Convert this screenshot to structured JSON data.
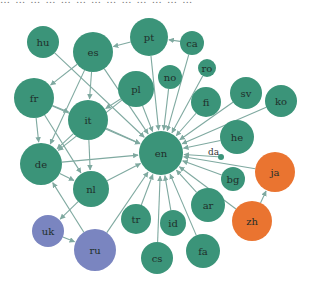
{
  "caption": "… … … … … … … … … … … … …",
  "colors": {
    "green": "#3b9479",
    "orange": "#ea7430",
    "blue": "#7a85c0",
    "edge": "#7fa9a0"
  },
  "nodes": [
    {
      "id": "en",
      "label": "en",
      "x": 161,
      "y": 153,
      "r": 22,
      "group": "green"
    },
    {
      "id": "hu",
      "label": "hu",
      "x": 43,
      "y": 42,
      "r": 16,
      "group": "green"
    },
    {
      "id": "es",
      "label": "es",
      "x": 93,
      "y": 52,
      "r": 20,
      "group": "green"
    },
    {
      "id": "pt",
      "label": "pt",
      "x": 149,
      "y": 37,
      "r": 19,
      "group": "green"
    },
    {
      "id": "ca",
      "label": "ca",
      "x": 192,
      "y": 43,
      "r": 12,
      "group": "green"
    },
    {
      "id": "ro",
      "label": "ro",
      "x": 207,
      "y": 68,
      "r": 9,
      "group": "green"
    },
    {
      "id": "no",
      "label": "no",
      "x": 170,
      "y": 77,
      "r": 12,
      "group": "green"
    },
    {
      "id": "pl",
      "label": "pl",
      "x": 136,
      "y": 89,
      "r": 18,
      "group": "green"
    },
    {
      "id": "fr",
      "label": "fr",
      "x": 34,
      "y": 98,
      "r": 20,
      "group": "green"
    },
    {
      "id": "it",
      "label": "it",
      "x": 88,
      "y": 120,
      "r": 20,
      "group": "green"
    },
    {
      "id": "fi",
      "label": "fi",
      "x": 206,
      "y": 102,
      "r": 15,
      "group": "green"
    },
    {
      "id": "sv",
      "label": "sv",
      "x": 246,
      "y": 93,
      "r": 16,
      "group": "green"
    },
    {
      "id": "ko",
      "label": "ko",
      "x": 281,
      "y": 101,
      "r": 16,
      "group": "green"
    },
    {
      "id": "he",
      "label": "he",
      "x": 237,
      "y": 137,
      "r": 17,
      "group": "green"
    },
    {
      "id": "da",
      "label": "da",
      "x": 221,
      "y": 157,
      "r": 3,
      "group": "green"
    },
    {
      "id": "bg",
      "label": "bg",
      "x": 233,
      "y": 179,
      "r": 12,
      "group": "green"
    },
    {
      "id": "de",
      "label": "de",
      "x": 41,
      "y": 164,
      "r": 21,
      "group": "green"
    },
    {
      "id": "nl",
      "label": "nl",
      "x": 91,
      "y": 189,
      "r": 18,
      "group": "green"
    },
    {
      "id": "ar",
      "label": "ar",
      "x": 208,
      "y": 205,
      "r": 17,
      "group": "green"
    },
    {
      "id": "tr",
      "label": "tr",
      "x": 136,
      "y": 219,
      "r": 15,
      "group": "green"
    },
    {
      "id": "id",
      "label": "id",
      "x": 173,
      "y": 223,
      "r": 13,
      "group": "green"
    },
    {
      "id": "cs",
      "label": "cs",
      "x": 157,
      "y": 258,
      "r": 16,
      "group": "green"
    },
    {
      "id": "fa",
      "label": "fa",
      "x": 203,
      "y": 251,
      "r": 17,
      "group": "green"
    },
    {
      "id": "ja",
      "label": "ja",
      "x": 275,
      "y": 172,
      "r": 20,
      "group": "orange"
    },
    {
      "id": "zh",
      "label": "zh",
      "x": 252,
      "y": 221,
      "r": 20,
      "group": "orange"
    },
    {
      "id": "uk",
      "label": "uk",
      "x": 48,
      "y": 231,
      "r": 16,
      "group": "blue"
    },
    {
      "id": "ru",
      "label": "ru",
      "x": 95,
      "y": 250,
      "r": 21,
      "group": "blue"
    }
  ],
  "edges": [
    [
      "hu",
      "en"
    ],
    [
      "es",
      "en"
    ],
    [
      "pt",
      "en"
    ],
    [
      "ca",
      "en"
    ],
    [
      "ro",
      "en"
    ],
    [
      "no",
      "en"
    ],
    [
      "pl",
      "en"
    ],
    [
      "fr",
      "en"
    ],
    [
      "it",
      "en"
    ],
    [
      "fi",
      "en"
    ],
    [
      "sv",
      "en"
    ],
    [
      "ko",
      "en"
    ],
    [
      "he",
      "en"
    ],
    [
      "da",
      "en"
    ],
    [
      "bg",
      "en"
    ],
    [
      "de",
      "en"
    ],
    [
      "nl",
      "en"
    ],
    [
      "ar",
      "en"
    ],
    [
      "tr",
      "en"
    ],
    [
      "id",
      "en"
    ],
    [
      "cs",
      "en"
    ],
    [
      "fa",
      "en"
    ],
    [
      "ja",
      "en"
    ],
    [
      "zh",
      "en"
    ],
    [
      "ru",
      "en"
    ],
    [
      "es",
      "fr"
    ],
    [
      "es",
      "it"
    ],
    [
      "es",
      "de"
    ],
    [
      "pt",
      "es"
    ],
    [
      "ca",
      "pt"
    ],
    [
      "fr",
      "it"
    ],
    [
      "fr",
      "de"
    ],
    [
      "fr",
      "nl"
    ],
    [
      "it",
      "de"
    ],
    [
      "it",
      "nl"
    ],
    [
      "de",
      "nl"
    ],
    [
      "nl",
      "uk"
    ],
    [
      "uk",
      "ru"
    ],
    [
      "ru",
      "de"
    ],
    [
      "zh",
      "ja"
    ],
    [
      "pl",
      "it"
    ],
    [
      "pl",
      "de"
    ]
  ]
}
